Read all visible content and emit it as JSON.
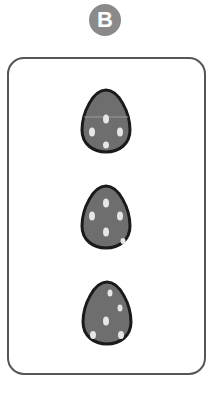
{
  "badge": {
    "label": "B",
    "color": "#8a8a8a"
  },
  "card": {
    "border_color": "#555555"
  },
  "eggs": [
    {
      "id": "egg-1",
      "fill": "#6e6e6e",
      "spots": 4
    },
    {
      "id": "egg-2",
      "fill": "#6e6e6e",
      "spots": 4
    },
    {
      "id": "egg-3",
      "fill": "#6e6e6e",
      "spots": 4
    }
  ]
}
